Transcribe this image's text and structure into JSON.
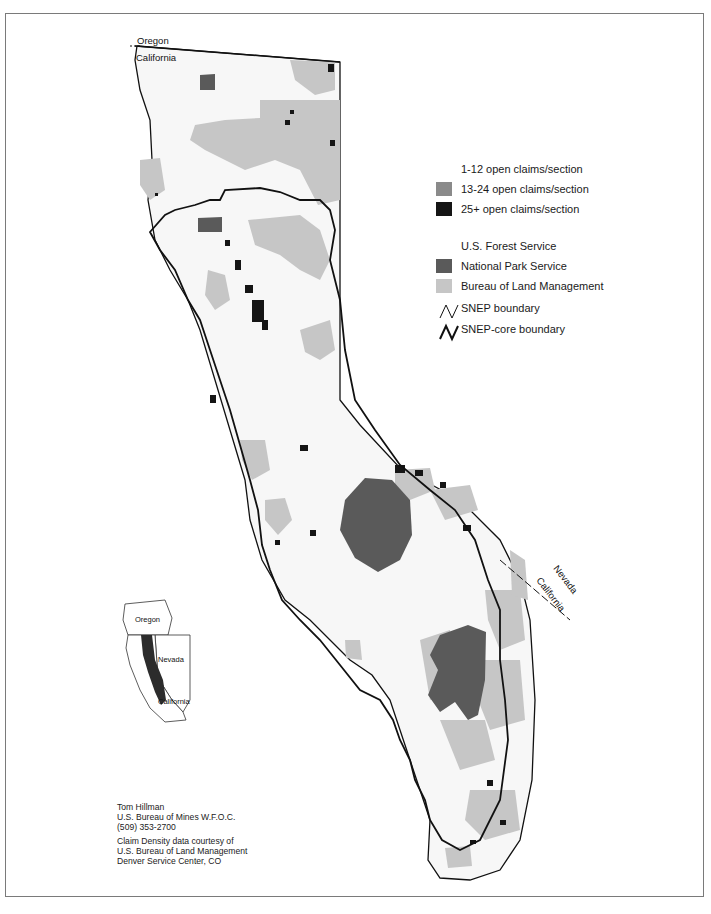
{
  "map": {
    "subject": "Mining claim density in the Sierra Nevada (SNEP study area)",
    "state_labels": {
      "oregon_top": "Oregon",
      "california_top": "California",
      "nevada_side": "Nevada",
      "california_side": "California"
    },
    "colors": {
      "forest_service": "#f7f7f7",
      "national_park_service": "#5a5a5a",
      "bureau_of_land_management": "#c6c6c6",
      "claims_1_12": "#f7f7f7",
      "claims_13_24": "#8a8a8a",
      "claims_25_plus": "#151515",
      "boundary": "#111111",
      "frame": "#7a7a7a"
    }
  },
  "legend": {
    "claims": [
      {
        "label": "1-12  open claims/section",
        "swatch": "#ffffff"
      },
      {
        "label": "13-24 open claims/section",
        "swatch": "#8a8a8a"
      },
      {
        "label": "25+   open claims/section",
        "swatch": "#151515"
      }
    ],
    "land": [
      {
        "label": "U.S. Forest Service",
        "swatch": "#ffffff"
      },
      {
        "label": "National Park Service",
        "swatch": "#5a5a5a"
      },
      {
        "label": "Bureau of Land Management",
        "swatch": "#c6c6c6"
      }
    ],
    "boundaries": [
      {
        "label": "SNEP boundary",
        "weight": "thin"
      },
      {
        "label": "SNEP-core boundary",
        "weight": "bold"
      }
    ]
  },
  "inset": {
    "labels": {
      "oregon": "Oregon",
      "nevada": "Nevada",
      "california": "California"
    }
  },
  "credits": {
    "author": [
      "Tom Hillman",
      "U.S. Bureau of Mines W.F.O.C.",
      "(509) 353-2700"
    ],
    "source": [
      "Claim Density data courtesy of",
      "U.S. Bureau of Land Management",
      "Denver Service Center, CO"
    ]
  }
}
